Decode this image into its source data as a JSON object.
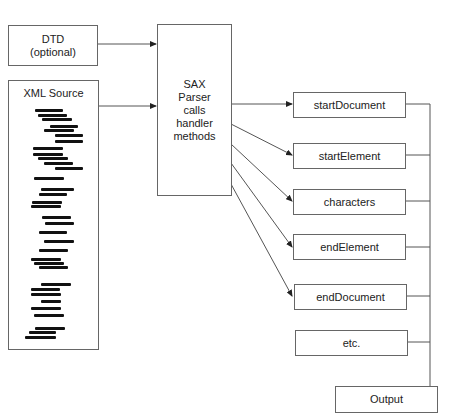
{
  "diagram": {
    "dtd_box": {
      "line1": "DTD",
      "line2": "(optional)"
    },
    "xml_source_box": {
      "title": "XML Source"
    },
    "parser_box": {
      "lines": [
        "SAX",
        "Parser",
        "calls",
        "handler",
        "methods"
      ]
    },
    "handler_methods": [
      {
        "label": "startDocument"
      },
      {
        "label": "startElement"
      },
      {
        "label": "characters"
      },
      {
        "label": "endElement"
      },
      {
        "label": "endDocument"
      },
      {
        "label": "etc."
      }
    ],
    "output_box": {
      "label": "Output"
    },
    "colors": {
      "line": "#555555",
      "box_border": "#666666",
      "code_lines": "#111111"
    }
  }
}
